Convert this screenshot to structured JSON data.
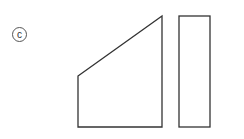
{
  "figure": {
    "label": "c",
    "stroke_color": "#333333",
    "shapes": [
      {
        "name": "trapezoid",
        "points": [
          [
            78,
            76
          ],
          [
            162,
            16
          ],
          [
            162,
            127
          ],
          [
            78,
            127
          ]
        ]
      },
      {
        "name": "rectangle",
        "x": 179,
        "y": 16,
        "width": 31,
        "height": 111
      }
    ]
  }
}
